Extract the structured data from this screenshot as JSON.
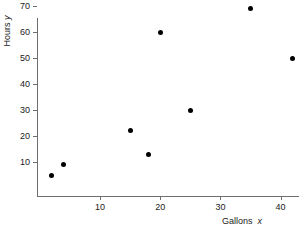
{
  "chart_data": {
    "type": "scatter",
    "title": "",
    "xlabel": "Gallons x",
    "ylabel": "Hours y",
    "xlabel_text": "Gallons",
    "xlabel_var": "x",
    "ylabel_text": "Hours",
    "ylabel_var": "y",
    "xlim": [
      0,
      44
    ],
    "ylim": [
      0,
      74
    ],
    "grid": false,
    "legend": "none",
    "xticks": [
      10,
      20,
      30,
      40
    ],
    "xtick_labels": [
      "10",
      "20",
      "30",
      "40"
    ],
    "yticks": [
      10,
      20,
      30,
      40,
      50,
      60,
      70
    ],
    "ytick_labels": [
      "10",
      "20",
      "30",
      "40",
      "50",
      "60",
      "70"
    ],
    "marker": "filled-circle",
    "marker_color": "#000000",
    "axis_color": "#6e6e6e",
    "points": [
      {
        "x": 2,
        "y": 5
      },
      {
        "x": 4,
        "y": 9
      },
      {
        "x": 15,
        "y": 22
      },
      {
        "x": 18,
        "y": 13
      },
      {
        "x": 20,
        "y": 60
      },
      {
        "x": 25,
        "y": 30
      },
      {
        "x": 35,
        "y": 69
      },
      {
        "x": 42,
        "y": 50
      }
    ]
  }
}
